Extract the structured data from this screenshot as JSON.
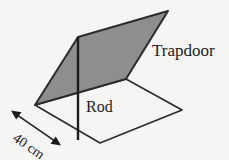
{
  "figure": {
    "name": "trapdoor-and-rod-diagram",
    "background_color": "#f5f5f4",
    "stroke_color": "#2b2b2b",
    "trapdoor_fill_color": "#8e8e8e",
    "labels": {
      "trapdoor": "Trapdoor",
      "rod": "Rod",
      "dimension": "40 cm"
    },
    "parts": {
      "trapdoor_panel": "trapdoor-panel",
      "floor_panel": "floor-panel",
      "rod_line": "rod-line",
      "dimension_arrow": "dimension-arrow"
    },
    "geometry": {
      "trapdoor_points": "35,105 78,37 168,11 126,79",
      "floor_points": "35,105 126,79 182,110 100,143",
      "rod_x1": 78,
      "rod_y1": 37,
      "rod_x2": 78,
      "rod_y2": 140,
      "arrow_x1": 13,
      "arrow_y1": 112,
      "arrow_x2": 59,
      "arrow_y2": 144
    }
  }
}
